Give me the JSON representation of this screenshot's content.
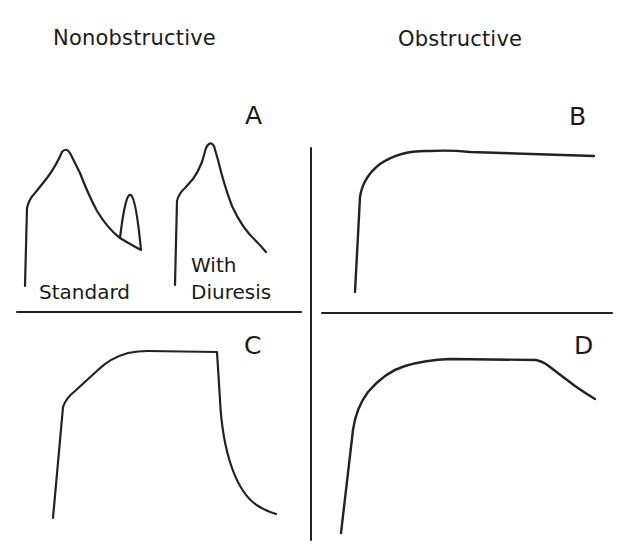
{
  "headings": {
    "left": "Nonobstructive",
    "right": "Obstructive"
  },
  "panels": {
    "A": {
      "letter": "A",
      "captions": {
        "standard": "Standard",
        "with_line1": "With",
        "with_line2": "Diuresis"
      }
    },
    "B": {
      "letter": "B"
    },
    "C": {
      "letter": "C"
    },
    "D": {
      "letter": "D"
    }
  },
  "colors": {
    "ink": "#222222",
    "background": "#ffffff"
  }
}
